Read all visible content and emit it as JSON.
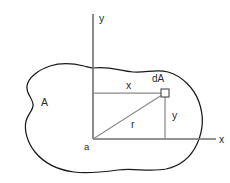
{
  "figure": {
    "background_color": "#ffffff",
    "outline_color": "#1a1a1a",
    "axis_color": "#6e6e6e",
    "dimension_color": "#8a8a8a",
    "label_color": "#2b2b2b"
  },
  "labels": {
    "y_axis": "y",
    "x_axis": "x",
    "region": "A",
    "origin": "a",
    "element": "dA",
    "horizontal_distance": "x",
    "vertical_distance": "y",
    "radial_distance": "r"
  },
  "geometry": {
    "origin": {
      "x": 93,
      "y": 139
    },
    "element_point": {
      "x": 165,
      "y": 93
    },
    "y_axis": {
      "x": 93,
      "y_top": 14,
      "y_bottom": 139
    },
    "x_axis": {
      "y": 139,
      "x_left": 93,
      "x_right": 216
    },
    "element_square_size": 8,
    "canvas": {
      "width": 230,
      "height": 183
    }
  },
  "label_positions": {
    "y_axis": {
      "x": 99,
      "y": 22
    },
    "x_axis": {
      "x": 219,
      "y": 143
    },
    "region": {
      "x": 41,
      "y": 106
    },
    "origin": {
      "x": 84,
      "y": 150
    },
    "element": {
      "x": 152,
      "y": 82
    },
    "horizontal_distance": {
      "x": 126,
      "y": 89
    },
    "vertical_distance": {
      "x": 172,
      "y": 119
    },
    "radial_distance": {
      "x": 131,
      "y": 128
    }
  }
}
